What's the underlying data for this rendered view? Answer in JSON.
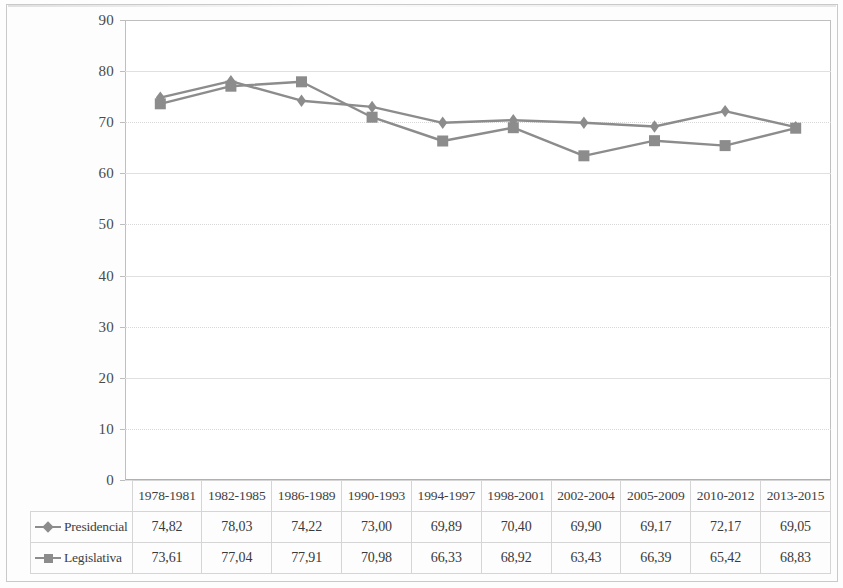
{
  "chart_data": {
    "type": "line",
    "title": "",
    "xlabel": "",
    "ylabel": "",
    "ylim": [
      0,
      90
    ],
    "ytick_step": 10,
    "yticks": [
      90,
      80,
      70,
      60,
      50,
      40,
      30,
      20,
      10,
      0
    ],
    "grid": true,
    "legend_position": "table-bottom",
    "categories": [
      "1978-1981",
      "1982-1985",
      "1986-1989",
      "1990-1993",
      "1994-1997",
      "1998-2001",
      "2002-2004",
      "2005-2009",
      "2010-2012",
      "2013-2015"
    ],
    "series": [
      {
        "name": "Presidencial",
        "marker": "diamond",
        "color": "#8c8c8c",
        "values": [
          74.82,
          78.03,
          74.22,
          73.0,
          69.89,
          70.4,
          69.9,
          69.17,
          72.17,
          69.05
        ],
        "labels": [
          "74,82",
          "78,03",
          "74,22",
          "73,00",
          "69,89",
          "70,40",
          "69,90",
          "69,17",
          "72,17",
          "69,05"
        ]
      },
      {
        "name": "Legislativa",
        "marker": "square",
        "color": "#8c8c8c",
        "values": [
          73.61,
          77.04,
          77.91,
          70.98,
          66.33,
          68.92,
          63.43,
          66.39,
          65.42,
          68.83
        ],
        "labels": [
          "73,61",
          "77,04",
          "77,91",
          "70,98",
          "66,33",
          "68,92",
          "63,43",
          "66,39",
          "65,42",
          "68,83"
        ]
      }
    ]
  },
  "colors": {
    "series": "#8c8c8c",
    "gridline": "#d8d8d8",
    "plot_border": "#bfbfbf",
    "table_border": "#d5d5d5",
    "text": "#3f3f3f"
  },
  "icons": {
    "presidencial_marker": "diamond-marker-icon",
    "legislativa_marker": "square-marker-icon"
  }
}
